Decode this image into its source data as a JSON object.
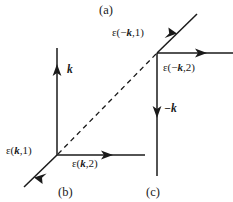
{
  "figure": {
    "width": 233,
    "height": 202,
    "background": "#ffffff",
    "stroke_color": "#1a1a1a",
    "panels": {
      "a": "(a)",
      "b": "(b)",
      "c": "(c)"
    },
    "labels": {
      "k_vector": "k",
      "minus_k_vector": "−k",
      "eps_k_1_prefix": "ε(",
      "eps_k_1_k": "k",
      "eps_k_1_suffix": ",1)",
      "eps_k_2_prefix": "ε(",
      "eps_k_2_k": "k",
      "eps_k_2_suffix": ",2)",
      "eps_mk_1_prefix": "ε(−",
      "eps_mk_1_k": "k",
      "eps_mk_1_suffix": ",1)",
      "eps_mk_2_prefix": "ε(−",
      "eps_mk_2_k": "k",
      "eps_mk_2_suffix": ",2)"
    },
    "geometry": {
      "origin_b": [
        57,
        155
      ],
      "origin_c": [
        157,
        53
      ],
      "dashed_line": "from origin_b to origin_c",
      "vertical_b": "x=57 from y=48 to y=155",
      "horizontal_b": "y=155 from x=57 to x=145",
      "diagonal_b": "from (57,155) to (24,187)",
      "vertical_c": "x=157 from y=53 to y=176",
      "horizontal_c": "y=53 from x=157 to x=233",
      "diagonal_c": "from (157,53) to (197,14)"
    }
  }
}
